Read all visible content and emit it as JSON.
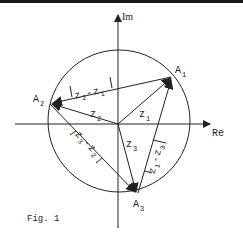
{
  "figure": {
    "caption": "Fig. 1",
    "axes": {
      "real": "Re",
      "imaginary": "Im"
    },
    "points": [
      {
        "name": "A1",
        "base": "A",
        "sub": "1"
      },
      {
        "name": "A2",
        "base": "A",
        "sub": "2"
      },
      {
        "name": "A3",
        "base": "A",
        "sub": "3"
      }
    ],
    "vectors": [
      {
        "base": "z",
        "sub": "1"
      },
      {
        "base": "z",
        "sub": "2"
      },
      {
        "base": "z",
        "sub": "3"
      }
    ],
    "differences": [
      {
        "label": "|z2-z1|",
        "a": "z",
        "a_sub": "2",
        "op": "-",
        "b": "z",
        "b_sub": "1"
      },
      {
        "label": "|z3-z2|",
        "a": "z",
        "a_sub": "3",
        "op": "-",
        "b": "z",
        "b_sub": "2"
      },
      {
        "label": "|z1-z3|",
        "a": "z",
        "a_sub": "1",
        "op": "-",
        "b": "z",
        "b_sub": "3"
      }
    ],
    "colors": {
      "ink": "#222222",
      "background": "#ffffff",
      "topbar": "#1a1a1a"
    }
  }
}
